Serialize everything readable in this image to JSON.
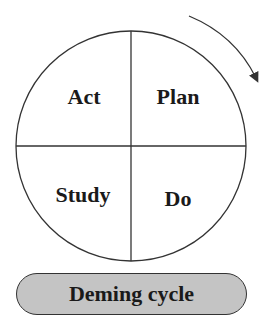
{
  "diagram": {
    "title": "Deming cycle",
    "quadrants": [
      {
        "position": "top-left",
        "label": "Act"
      },
      {
        "position": "top-right",
        "label": "Plan"
      },
      {
        "position": "bottom-left",
        "label": "Study"
      },
      {
        "position": "bottom-right",
        "label": "Do"
      }
    ],
    "arrow": {
      "direction": "clockwise"
    },
    "colors": {
      "stroke": "#333333",
      "pill_fill": "#c4c4c4",
      "text": "#1a1a1a"
    }
  }
}
